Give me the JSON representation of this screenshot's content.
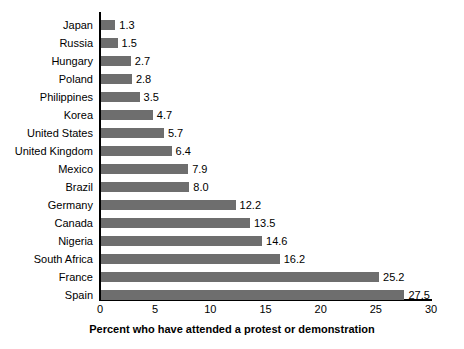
{
  "chart_data": {
    "type": "bar",
    "orientation": "horizontal",
    "title": "",
    "xlabel": "Percent who have attended a protest or demonstration",
    "ylabel": "",
    "xlim": [
      0,
      30
    ],
    "xticks": [
      0,
      5,
      10,
      15,
      20,
      25,
      30
    ],
    "grid": false,
    "legend": null,
    "bar_color": "#6e6e6e",
    "axis_color": "#000000",
    "background": "#ffffff",
    "value_label_format": "one-decimal",
    "categories": [
      "Japan",
      "Russia",
      "Hungary",
      "Poland",
      "Philippines",
      "Korea",
      "United States",
      "United Kingdom",
      "Mexico",
      "Brazil",
      "Germany",
      "Canada",
      "Nigeria",
      "South Africa",
      "France",
      "Spain"
    ],
    "values": [
      1.3,
      1.5,
      2.7,
      2.8,
      3.5,
      4.7,
      5.7,
      6.4,
      7.9,
      8.0,
      12.2,
      13.5,
      14.6,
      16.2,
      25.2,
      27.5
    ],
    "value_labels": [
      "1.3",
      "1.5",
      "2.7",
      "2.8",
      "3.5",
      "4.7",
      "5.7",
      "6.4",
      "7.9",
      "8.0",
      "12.2",
      "13.5",
      "14.6",
      "16.2",
      "25.2",
      "27.5"
    ],
    "tick_labels": [
      "0",
      "5",
      "10",
      "15",
      "20",
      "25",
      "30"
    ]
  }
}
